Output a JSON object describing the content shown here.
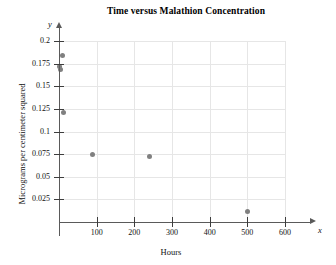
{
  "chart_data": {
    "type": "scatter",
    "title": "Time versus Malathion Concentration",
    "xlabel": "Hours",
    "ylabel": "Micrograms per centimeter squared",
    "x_var": "x",
    "y_var": "y",
    "xlim": [
      0,
      600
    ],
    "ylim": [
      0,
      0.2
    ],
    "grid": true,
    "legend": null,
    "xticks": [
      100,
      200,
      300,
      400,
      500,
      600
    ],
    "xtick_labels": [
      "100",
      "200",
      "300",
      "400",
      "500",
      "600"
    ],
    "yticks": [
      0.025,
      0.05,
      0.075,
      0.1,
      0.125,
      0.15,
      0.175,
      0.2
    ],
    "ytick_labels": [
      "0.025",
      "0.05",
      "0.075",
      "0.1",
      "0.125",
      "0.15",
      "0.175",
      "0.2"
    ],
    "point_color": "#808080",
    "grid_color": "#e6e6e6",
    "axis_color": "#5a5a5a",
    "points": [
      {
        "x": 8,
        "y": 0.184
      },
      {
        "x": 0,
        "y": 0.172
      },
      {
        "x": 5,
        "y": 0.169
      },
      {
        "x": 11,
        "y": 0.121
      },
      {
        "x": 90,
        "y": 0.075
      },
      {
        "x": 240,
        "y": 0.072
      },
      {
        "x": 500,
        "y": 0.012
      }
    ]
  }
}
